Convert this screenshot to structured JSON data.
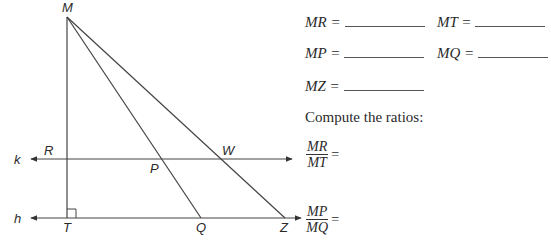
{
  "diagram": {
    "points": {
      "M": {
        "label": "M",
        "x": 67,
        "y": 17
      },
      "R": {
        "label": "R",
        "x": 67,
        "y": 159
      },
      "T": {
        "label": "T",
        "x": 67,
        "y": 218
      },
      "P": {
        "label": "P",
        "x": 162,
        "y": 159
      },
      "Q": {
        "label": "Q",
        "x": 201,
        "y": 218
      },
      "W": {
        "label": "W",
        "x": 221,
        "y": 159
      },
      "Z": {
        "label": "Z",
        "x": 285,
        "y": 218
      }
    },
    "lines": {
      "k": {
        "label": "k"
      },
      "h": {
        "label": "h"
      }
    },
    "right_angle_at": "T"
  },
  "measurements": {
    "MR": {
      "label": "MR =",
      "value": ""
    },
    "MT": {
      "label": "MT =",
      "value": ""
    },
    "MP": {
      "label": "MP =",
      "value": ""
    },
    "MQ": {
      "label": "MQ =",
      "value": ""
    },
    "MZ": {
      "label": "MZ =",
      "value": ""
    }
  },
  "instruction": "Compute the ratios:",
  "ratios": [
    {
      "numerator": "MR",
      "denominator": "MT",
      "equals": "=",
      "value": ""
    },
    {
      "numerator": "MP",
      "denominator": "MQ",
      "equals": "=",
      "value": ""
    }
  ]
}
